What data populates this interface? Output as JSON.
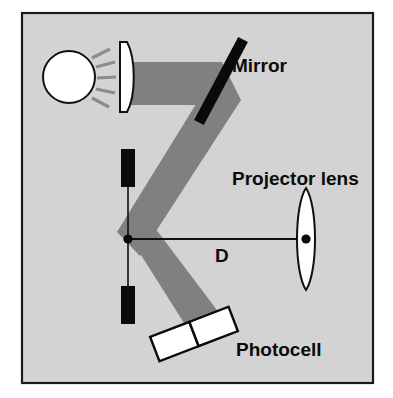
{
  "figure": {
    "frame": {
      "border_color": "#1a1a1a",
      "background_color": "#d3d3d3",
      "page_color": "#ffffff"
    }
  },
  "colors": {
    "beam": "#808080",
    "ray": "#8c8c8c",
    "outline": "#000000",
    "component_fill": "#ffffff",
    "opaque_component": "#000000",
    "panel": "#d3d3d3"
  },
  "labels": {
    "mirror": "Mirror",
    "projector_lens": "Projector lens",
    "photocell": "Photocell",
    "distance": "D"
  },
  "components": {
    "lamp": {
      "name": "light-source",
      "shape": "circle",
      "fill": "#ffffff"
    },
    "rays": {
      "name": "light-rays",
      "count": 5
    },
    "condenser_lens": {
      "name": "condenser-lens",
      "shape": "plano-convex",
      "fill": "#ffffff"
    },
    "mirror": {
      "name": "mirror",
      "shape": "tilted-bar",
      "fill": "#000000"
    },
    "slit_upper": {
      "name": "slit-blade-upper",
      "shape": "bar",
      "fill": "#000000"
    },
    "slit_lower": {
      "name": "slit-blade-lower",
      "shape": "bar",
      "fill": "#000000"
    },
    "focal_point": {
      "name": "focal-point-marker",
      "shape": "dot",
      "fill": "#000000"
    },
    "projector_lens": {
      "name": "projector-lens",
      "shape": "biconvex",
      "fill": "#ffffff"
    },
    "projector_lens_center": {
      "name": "projector-lens-center-dot",
      "shape": "dot",
      "fill": "#000000"
    },
    "photocell_cell_a": {
      "name": "photocell-cell-left",
      "shape": "rect",
      "fill": "#ffffff"
    },
    "photocell_cell_b": {
      "name": "photocell-cell-right",
      "shape": "rect",
      "fill": "#ffffff"
    },
    "distance_line": {
      "name": "distance-measure-line",
      "shape": "line"
    },
    "beam": {
      "name": "light-beam-path",
      "shape": "z-folded-band"
    }
  }
}
